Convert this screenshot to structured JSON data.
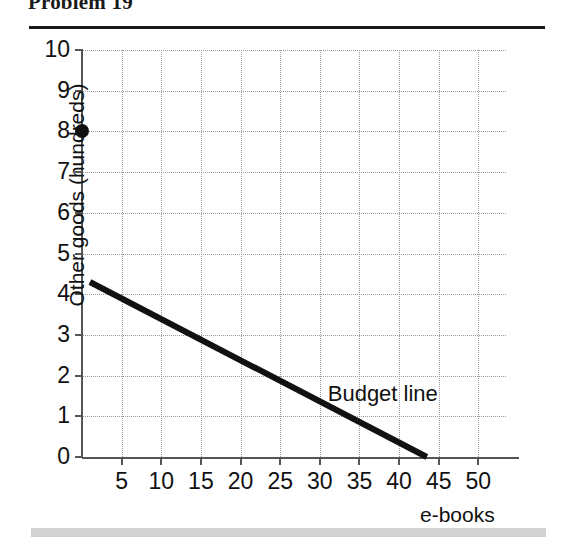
{
  "header": {
    "title": "Problem 19"
  },
  "chart_data": {
    "type": "line",
    "title": "Problem 19",
    "xlabel": "e-books",
    "ylabel": "Other goods (hundreds)",
    "xlim": [
      0,
      55
    ],
    "ylim": [
      0,
      10
    ],
    "grid": true,
    "legend": "none",
    "x_ticks": [
      5,
      10,
      15,
      20,
      25,
      30,
      35,
      40,
      45,
      50
    ],
    "x_tick_labels": [
      "5",
      "10",
      "15",
      "20",
      "25",
      "30",
      "35",
      "40",
      "45",
      "50"
    ],
    "y_ticks": [
      0,
      1,
      2,
      3,
      4,
      5,
      6,
      7,
      8,
      9,
      10
    ],
    "y_tick_labels": [
      "0",
      "1",
      "2",
      "3",
      "4",
      "5",
      "6",
      "7",
      "8",
      "9",
      "10"
    ],
    "series": [
      {
        "name": "Budget line",
        "type": "line",
        "label": "Budget line",
        "color": "#111111",
        "linewidth": 6,
        "x": [
          1,
          43.5
        ],
        "y": [
          4.3,
          0
        ],
        "points": [
          [
            1,
            4.3
          ],
          [
            43.5,
            0
          ]
        ]
      },
      {
        "name": "Endowment point",
        "type": "scatter",
        "color": "#111111",
        "marker": "circle",
        "x": [
          0
        ],
        "y": [
          8
        ],
        "points": [
          [
            0,
            8
          ]
        ]
      }
    ],
    "annotations": [
      {
        "text": "Budget line",
        "x": 31,
        "y": 1.55
      }
    ]
  }
}
